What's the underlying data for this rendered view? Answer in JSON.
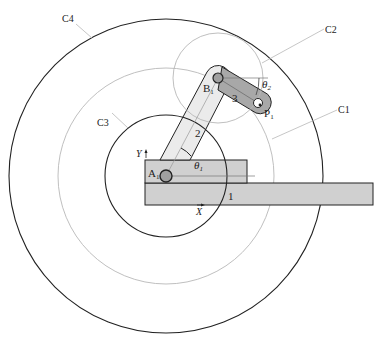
{
  "diagram": {
    "type": "two-link planar manipulator workspace",
    "colors": {
      "outline": "#222222",
      "construction_line": "#b8b8b8",
      "base_fill": "#d0d0d0",
      "link2_fill": "#ebebeb",
      "link3_fill": "#a8a8a8",
      "joint_fill": "#a0a0a0",
      "background": "#ffffff"
    },
    "circles": [
      {
        "id": "C1",
        "label": "C1",
        "style": "thin-gray",
        "cx": 166,
        "cy": 176,
        "r": 108
      },
      {
        "id": "C2",
        "label": "C2",
        "style": "thin-gray",
        "cx": 218,
        "cy": 78,
        "r": 45
      },
      {
        "id": "C3",
        "label": "C3",
        "style": "black",
        "cx": 166,
        "cy": 176,
        "r": 61
      },
      {
        "id": "C4",
        "label": "C4",
        "style": "black",
        "cx": 166,
        "cy": 176,
        "r": 157
      }
    ],
    "joints": {
      "A1": {
        "label": "A",
        "sub": "1"
      },
      "B1": {
        "label": "B",
        "sub": "1"
      },
      "P1": {
        "label": "P",
        "sub": "1"
      }
    },
    "links": [
      {
        "id": "link1",
        "label": "1"
      },
      {
        "id": "link2",
        "label": "2"
      },
      {
        "id": "link3",
        "label": "3"
      }
    ],
    "angles": {
      "theta1": {
        "symbol": "θ",
        "sub": "1"
      },
      "theta2": {
        "symbol": "θ",
        "sub": "2"
      }
    },
    "axes": {
      "x_label": "X",
      "y_label": "Y"
    }
  }
}
